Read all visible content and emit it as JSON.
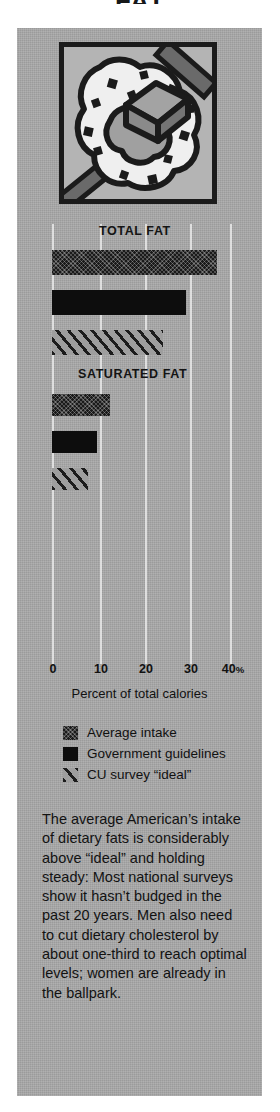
{
  "headline": {
    "text": "FAT"
  },
  "illustration": {
    "name": "pat-of-butter-on-bread-illustration",
    "description": "Line illustration of a square pat of butter melting on a slice of speckled bread"
  },
  "chart_data": {
    "type": "bar",
    "title": "",
    "xlabel": "Percent of total calories",
    "ylabel": "",
    "xlim": [
      0,
      40
    ],
    "xticks": [
      0,
      10,
      20,
      30,
      40
    ],
    "xticklabels": [
      "0",
      "10",
      "20",
      "30",
      "40%"
    ],
    "xtick_suffix": "%",
    "grid": true,
    "orientation": "horizontal",
    "legend_position": "below-axis",
    "groups": [
      {
        "label": "TOTAL FAT",
        "bars": [
          {
            "series": "Average intake",
            "value": 37
          },
          {
            "series": "Government guidelines",
            "value": 30
          },
          {
            "series": "CU survey “ideal”",
            "value": 25
          }
        ]
      },
      {
        "label": "SATURATED FAT",
        "bars": [
          {
            "series": "Average intake",
            "value": 13
          },
          {
            "series": "Government guidelines",
            "value": 10
          },
          {
            "series": "CU survey “ideal”",
            "value": 8
          }
        ]
      }
    ],
    "series": [
      {
        "name": "Average intake",
        "key": "average",
        "values": [
          37,
          13
        ],
        "fill": "stippled-dark",
        "color": "#1a1a1a"
      },
      {
        "name": "Government guidelines",
        "key": "government",
        "values": [
          30,
          10
        ],
        "fill": "solid-black",
        "color": "#0d0d0d"
      },
      {
        "name": "CU survey “ideal”",
        "key": "cu",
        "values": [
          25,
          8
        ],
        "fill": "diagonal-hatch",
        "color": "#9e9e9e"
      }
    ],
    "categories": [
      "TOTAL FAT",
      "SATURATED FAT"
    ]
  },
  "legend": {
    "items": [
      {
        "label": "Average intake",
        "swatch": "stippled-dark"
      },
      {
        "label": "Government guidelines",
        "swatch": "solid-black"
      },
      {
        "label": "CU survey “ideal”",
        "swatch": "diagonal-hatch"
      }
    ]
  },
  "body": {
    "text": "The average American’s intake of dietary fats is considerably above “ideal” and holding steady: Most national surveys show it hasn’t budged in the past 20 years. Men also need to cut dietary cholesterol by about one-third to reach optimal levels; women are already in the ballpark."
  },
  "colors": {
    "panel_background": "#a9a9a9",
    "page_background": "#ffffff",
    "ink": "#121212",
    "gridline": "#eeeeee"
  }
}
